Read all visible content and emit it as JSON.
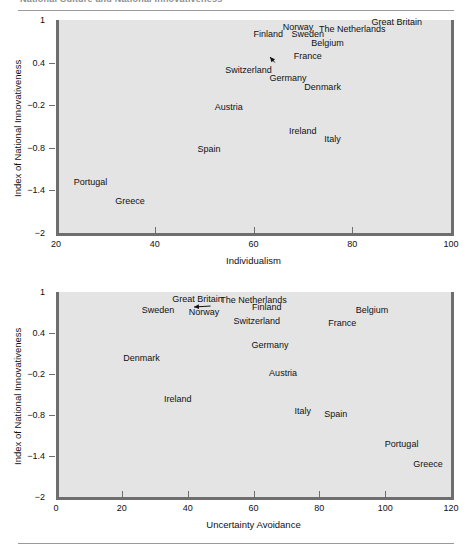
{
  "figure": {
    "clipped_header_text": "National Culture and National Innovativeness",
    "rules": {
      "top_label": "top-rule",
      "bottom_label": "bottom-rule"
    }
  },
  "chart_data": [
    {
      "id": "individualism",
      "type": "scatter",
      "title": "",
      "xlabel": "Individualism",
      "ylabel": "Index of National Innovativeness",
      "xlim": [
        20,
        100
      ],
      "ylim": [
        -2,
        1
      ],
      "xticks": [
        20,
        40,
        60,
        80,
        100
      ],
      "xtick_labels": [
        "20",
        "40",
        "60",
        "80",
        "100"
      ],
      "yticks": [
        1,
        0.4,
        -0.2,
        -0.8,
        -1.4,
        -2
      ],
      "ytick_labels": [
        "1",
        "0.4",
        "−0.2",
        "−0.8",
        "−1.4",
        "−2"
      ],
      "grid": false,
      "legend": "none",
      "points": [
        {
          "label": "Great Britain",
          "x": 89,
          "y": 0.97,
          "anchor": "middle"
        },
        {
          "label": "The Netherlands",
          "x": 80,
          "y": 0.88,
          "anchor": "middle"
        },
        {
          "label": "Norway",
          "x": 69,
          "y": 0.9,
          "anchor": "middle"
        },
        {
          "label": "Sweden",
          "x": 71,
          "y": 0.8,
          "anchor": "middle"
        },
        {
          "label": "Finland",
          "x": 63,
          "y": 0.8,
          "anchor": "middle"
        },
        {
          "label": "Belgium",
          "x": 75,
          "y": 0.67,
          "anchor": "middle"
        },
        {
          "label": "France",
          "x": 71,
          "y": 0.49,
          "anchor": "middle"
        },
        {
          "label": "Switzerland",
          "x": 59,
          "y": 0.3,
          "anchor": "middle"
        },
        {
          "label": "Germany",
          "x": 67,
          "y": 0.19,
          "anchor": "middle"
        },
        {
          "label": "Denmark",
          "x": 74,
          "y": 0.06,
          "anchor": "middle"
        },
        {
          "label": "Austria",
          "x": 55,
          "y": -0.22,
          "anchor": "middle"
        },
        {
          "label": "Ireland",
          "x": 70,
          "y": -0.57,
          "anchor": "middle"
        },
        {
          "label": "Italy",
          "x": 76,
          "y": -0.67,
          "anchor": "middle"
        },
        {
          "label": "Spain",
          "x": 51,
          "y": -0.82,
          "anchor": "middle"
        },
        {
          "label": "Portugal",
          "x": 27,
          "y": -1.28,
          "anchor": "middle"
        },
        {
          "label": "Greece",
          "x": 35,
          "y": -1.55,
          "anchor": "middle"
        }
      ],
      "leader_line": {
        "from_label": "Switzerland",
        "to_label": "France",
        "description": "arrow from Switzerland label up-right to France data point"
      }
    },
    {
      "id": "uncertainty-avoidance",
      "type": "scatter",
      "title": "",
      "xlabel": "Uncertainty Avoidance",
      "ylabel": "Index of National Innovativeness",
      "xlim": [
        0,
        120
      ],
      "ylim": [
        -2,
        1
      ],
      "xticks": [
        0,
        20,
        40,
        60,
        80,
        100,
        120
      ],
      "xtick_labels": [
        "0",
        "20",
        "40",
        "60",
        "80",
        "100",
        "120"
      ],
      "yticks": [
        1,
        0.4,
        -0.2,
        -0.8,
        -1.4,
        -2
      ],
      "ytick_labels": [
        "1",
        "0.4",
        "−0.2",
        "−0.8",
        "−1.4",
        "−2"
      ],
      "grid": false,
      "legend": "none",
      "points": [
        {
          "label": "Great Britain",
          "x": 43,
          "y": 0.9,
          "anchor": "middle"
        },
        {
          "label": "The Netherlands",
          "x": 60,
          "y": 0.88,
          "anchor": "middle"
        },
        {
          "label": "Finland",
          "x": 64,
          "y": 0.78,
          "anchor": "middle"
        },
        {
          "label": "Sweden",
          "x": 31,
          "y": 0.74,
          "anchor": "middle"
        },
        {
          "label": "Norway",
          "x": 45,
          "y": 0.71,
          "anchor": "middle"
        },
        {
          "label": "Belgium",
          "x": 96,
          "y": 0.73,
          "anchor": "middle"
        },
        {
          "label": "Switzerland",
          "x": 61,
          "y": 0.58,
          "anchor": "middle"
        },
        {
          "label": "France",
          "x": 87,
          "y": 0.55,
          "anchor": "middle"
        },
        {
          "label": "Germany",
          "x": 65,
          "y": 0.23,
          "anchor": "middle"
        },
        {
          "label": "Denmark",
          "x": 26,
          "y": 0.03,
          "anchor": "middle"
        },
        {
          "label": "Austria",
          "x": 69,
          "y": -0.19,
          "anchor": "middle"
        },
        {
          "label": "Ireland",
          "x": 37,
          "y": -0.56,
          "anchor": "middle"
        },
        {
          "label": "Italy",
          "x": 75,
          "y": -0.74,
          "anchor": "middle"
        },
        {
          "label": "Spain",
          "x": 85,
          "y": -0.79,
          "anchor": "middle"
        },
        {
          "label": "Portugal",
          "x": 105,
          "y": -1.23,
          "anchor": "middle"
        },
        {
          "label": "Greece",
          "x": 113,
          "y": -1.52,
          "anchor": "middle"
        }
      ],
      "leader_line": {
        "from_label": "Norway",
        "to_label": "Great Britain",
        "description": "arrow from Norway label up-right to Great Britain data point"
      }
    }
  ],
  "colors": {
    "plot_background": "#e4e4e4",
    "axis": "#6e6e6e",
    "text": "#111111",
    "rule": "#9a9a9a",
    "page_background": "#ffffff"
  }
}
